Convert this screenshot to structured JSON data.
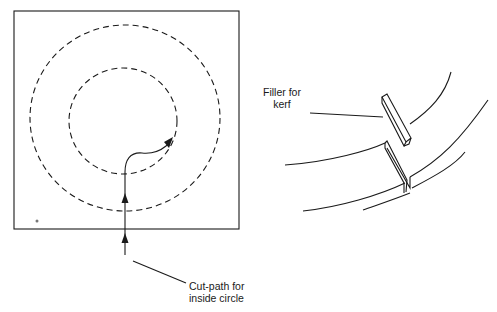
{
  "figure": {
    "left_panel": {
      "description": "Square workpiece with two concentric dashed circles and an arrowed cut path entering from the bottom edge",
      "label": {
        "line1": "Cut-path for",
        "line2": "inside circle"
      }
    },
    "right_panel": {
      "description": "Curved ring segments with a kerf gap and a rectangular filler piece",
      "label": {
        "line1": "Filler for",
        "line2": "kerf"
      }
    },
    "colors": {
      "ink": "#1a1a1a",
      "background": "#ffffff"
    }
  }
}
